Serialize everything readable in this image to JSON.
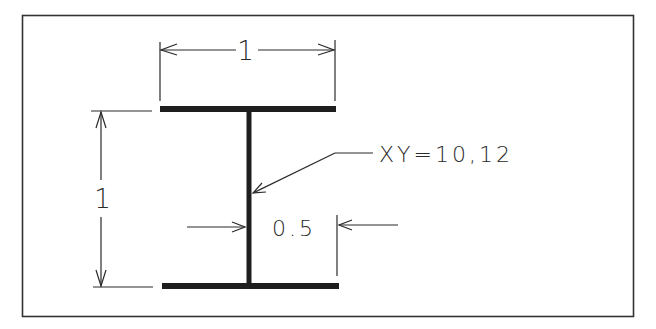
{
  "diagram": {
    "type": "engineering-drawing",
    "colors": {
      "background": "#ffffff",
      "frame": "#333333",
      "section": "#1e1e1e",
      "dimension": "#2a2a2a"
    },
    "dimensions": {
      "flange_width": {
        "label": "1"
      },
      "section_height": {
        "label": "1"
      },
      "web_offset": {
        "label": "0.5"
      }
    },
    "annotation": {
      "leader_label": "XY=10,12"
    }
  }
}
